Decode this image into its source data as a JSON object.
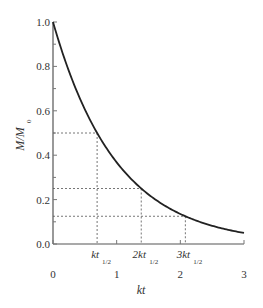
{
  "chart_data": {
    "type": "line",
    "title": "",
    "xlabel": "kt",
    "ylabel": "M/M0",
    "ylabel_main": "M/M",
    "ylabel_sub": "0",
    "xlim": [
      0,
      3
    ],
    "ylim": [
      0,
      1.0
    ],
    "x_ticks": [
      "0",
      "1",
      "2",
      "3"
    ],
    "y_ticks": [
      "0.0",
      "0.2",
      "0.4",
      "0.6",
      "0.8",
      "1.0"
    ],
    "grid": false,
    "legend": null,
    "series": [
      {
        "name": "M/M0 = exp(-kt)",
        "x": [
          0,
          0.25,
          0.5,
          0.693,
          1.0,
          1.386,
          1.5,
          2.0,
          2.079,
          2.5,
          3.0
        ],
        "y": [
          1.0,
          0.779,
          0.607,
          0.5,
          0.368,
          0.25,
          0.223,
          0.135,
          0.125,
          0.082,
          0.05
        ]
      }
    ],
    "annotations": [
      {
        "label_main": "kt",
        "label_sub": "1/2",
        "prefix": "",
        "x": 0.693,
        "y": 0.5
      },
      {
        "label_main": "kt",
        "label_sub": "1/2",
        "prefix": "2",
        "x": 1.386,
        "y": 0.25
      },
      {
        "label_main": "kt",
        "label_sub": "1/2",
        "prefix": "3",
        "x": 2.079,
        "y": 0.125
      }
    ]
  }
}
